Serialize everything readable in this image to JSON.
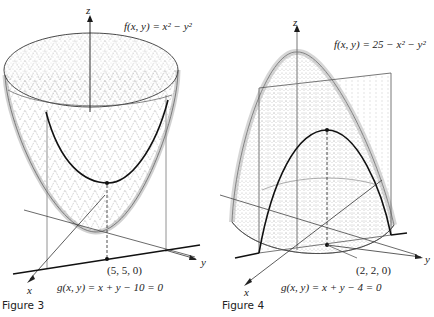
{
  "figures": [
    {
      "id": "figure-3",
      "caption": "Figure 3",
      "function_label": "f(x, y) = x² − y²",
      "constraint_label": "g(x, y) = x + y − 10 = 0",
      "point_label": "(5, 5, 0)",
      "axes": {
        "x": "x",
        "y": "y",
        "z": "z"
      }
    },
    {
      "id": "figure-4",
      "caption": "Figure 4",
      "function_label": "f(x, y) = 25 − x² − y²",
      "constraint_label": "g(x, y) = x + y − 4 = 0",
      "point_label": "(2, 2, 0)",
      "axes": {
        "x": "x",
        "y": "y",
        "z": "z"
      }
    }
  ],
  "colors": {
    "line": "#1a1a1a",
    "surface_shade": "#9a9a9a",
    "plane_edge": "#555555",
    "background": "#ffffff"
  }
}
